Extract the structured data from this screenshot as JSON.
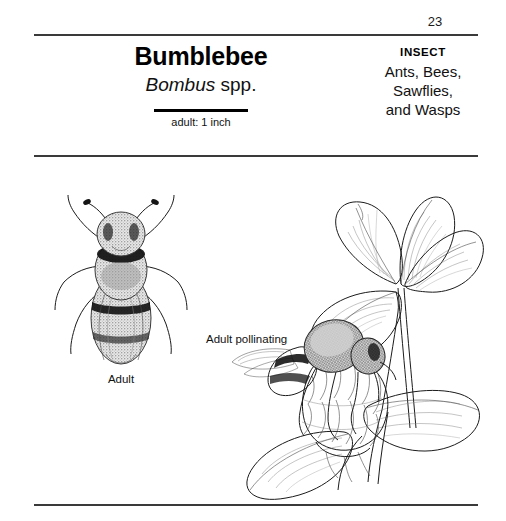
{
  "page": {
    "number": "23",
    "background_color": "#ffffff",
    "rule_color": "#3a3a3a"
  },
  "header": {
    "common_name": "Bumblebee",
    "scientific_name": {
      "genus": "Bombus",
      "qualifier": "spp."
    },
    "scale": {
      "label": "adult: 1 inch"
    },
    "category": {
      "kicker": "INSECT",
      "lines": [
        "Ants, Bees,",
        "Sawflies,",
        "and Wasps"
      ]
    }
  },
  "plates": [
    {
      "id": "adult",
      "caption": "Adult",
      "subject": "bumblebee-adult-dorsal-illustration"
    },
    {
      "id": "pollinating",
      "caption": "Adult pollinating",
      "subject": "bumblebee-on-red-clover-illustration"
    }
  ],
  "icons": {
    "scale_bar": "horizontal-scale-bar",
    "rule": "horizontal-divider-rule"
  }
}
